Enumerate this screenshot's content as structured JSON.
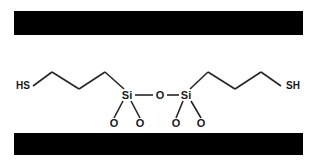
{
  "figure": {
    "background_color": "#ffffff",
    "bond_color": "#262626",
    "label_color": "#1a1a1a",
    "substrate_color": "#000000"
  },
  "substrates": [
    {
      "name": "top-substrate",
      "x": 14,
      "y": 11,
      "width": 289,
      "height": 24,
      "color": "#000000"
    },
    {
      "name": "bottom-substrate",
      "x": 14,
      "y": 133,
      "width": 289,
      "height": 22,
      "color": "#000000"
    }
  ],
  "molecule": {
    "name": "siloxane-bridge",
    "bond_color": "#262626",
    "bond_width": 1.6,
    "labels": [
      {
        "id": "hs-left",
        "text": "HS",
        "x": 16,
        "y": 89,
        "anchor": "start",
        "size": 10
      },
      {
        "id": "si-left",
        "text": "Si",
        "x": 127,
        "y": 99,
        "anchor": "middle",
        "size": 11
      },
      {
        "id": "o-bridge",
        "text": "O",
        "x": 160,
        "y": 99,
        "anchor": "middle",
        "size": 11
      },
      {
        "id": "si-right",
        "text": "Si",
        "x": 186,
        "y": 99,
        "anchor": "middle",
        "size": 11
      },
      {
        "id": "o-left-1",
        "text": "O",
        "x": 114,
        "y": 127,
        "anchor": "middle",
        "size": 11
      },
      {
        "id": "o-left-2",
        "text": "O",
        "x": 140,
        "y": 127,
        "anchor": "middle",
        "size": 11
      },
      {
        "id": "o-right-1",
        "text": "O",
        "x": 176,
        "y": 127,
        "anchor": "middle",
        "size": 11
      },
      {
        "id": "o-right-2",
        "text": "O",
        "x": 201,
        "y": 127,
        "anchor": "middle",
        "size": 11
      },
      {
        "id": "sh-right",
        "text": "SH",
        "x": 300,
        "y": 89,
        "anchor": "end",
        "size": 10
      }
    ],
    "bonds": [
      {
        "id": "bond-hs-c1-left",
        "x1": 33,
        "y1": 86,
        "x2": 52,
        "y2": 72
      },
      {
        "id": "bond-c1-c2-left",
        "x1": 52,
        "y1": 72,
        "x2": 79,
        "y2": 89
      },
      {
        "id": "bond-c2-c3-left",
        "x1": 79,
        "y1": 89,
        "x2": 105,
        "y2": 72
      },
      {
        "id": "bond-c3-si-left",
        "x1": 105,
        "y1": 72,
        "x2": 124,
        "y2": 89
      },
      {
        "id": "bond-si-o-bridge",
        "x1": 135,
        "y1": 95,
        "x2": 153,
        "y2": 95
      },
      {
        "id": "bond-o-si-bridge",
        "x1": 167,
        "y1": 95,
        "x2": 179,
        "y2": 95
      },
      {
        "id": "bond-si-o1-left",
        "x1": 123,
        "y1": 101,
        "x2": 114,
        "y2": 118
      },
      {
        "id": "bond-si-o2-left",
        "x1": 131,
        "y1": 101,
        "x2": 140,
        "y2": 118
      },
      {
        "id": "bond-si-o1-right",
        "x1": 183,
        "y1": 101,
        "x2": 176,
        "y2": 118
      },
      {
        "id": "bond-si-o2-right",
        "x1": 191,
        "y1": 101,
        "x2": 201,
        "y2": 118
      },
      {
        "id": "bond-si-c3-right",
        "x1": 190,
        "y1": 89,
        "x2": 208,
        "y2": 72
      },
      {
        "id": "bond-c3-c2-right",
        "x1": 208,
        "y1": 72,
        "x2": 235,
        "y2": 89
      },
      {
        "id": "bond-c2-c1-right",
        "x1": 235,
        "y1": 89,
        "x2": 261,
        "y2": 72
      },
      {
        "id": "bond-c1-sh-right",
        "x1": 261,
        "y1": 72,
        "x2": 281,
        "y2": 86
      }
    ]
  }
}
